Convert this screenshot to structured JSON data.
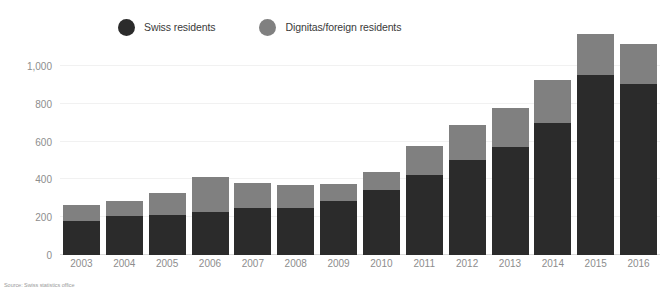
{
  "legend": {
    "items": [
      {
        "label": "Swiss residents",
        "color": "#2b2b2b",
        "icon": "circle-icon"
      },
      {
        "label": "Dignitas/foreign residents",
        "color": "#808080",
        "icon": "circle-icon"
      }
    ]
  },
  "source": {
    "text": "Source: Swiss statistics office"
  },
  "chart_data": {
    "type": "bar",
    "title": "",
    "subtitle": "",
    "xlabel": "",
    "ylabel": "",
    "stacked": true,
    "grid": true,
    "legend_position": "top",
    "ylim": [
      0,
      1100
    ],
    "yticks": [
      0,
      200,
      400,
      600,
      800,
      1000
    ],
    "ytick_labels": [
      "0",
      "200",
      "400",
      "600",
      "800",
      "1,000"
    ],
    "categories": [
      "2003",
      "2004",
      "2005",
      "2006",
      "2007",
      "2008",
      "2009",
      "2010",
      "2011",
      "2012",
      "2013",
      "2014",
      "2015",
      "2016"
    ],
    "series": [
      {
        "name": "Swiss residents",
        "color": "#2b2b2b",
        "values": [
          180,
          205,
          210,
          230,
          250,
          250,
          285,
          345,
          425,
          505,
          570,
          700,
          950,
          905
        ]
      },
      {
        "name": "Dignitas/foreign residents",
        "color": "#808080",
        "values": [
          85,
          80,
          120,
          180,
          130,
          120,
          90,
          95,
          150,
          180,
          210,
          225,
          220,
          210
        ]
      }
    ],
    "totals": [
      265,
      285,
      330,
      410,
      380,
      370,
      375,
      440,
      575,
      685,
      780,
      925,
      1170,
      1115
    ]
  }
}
